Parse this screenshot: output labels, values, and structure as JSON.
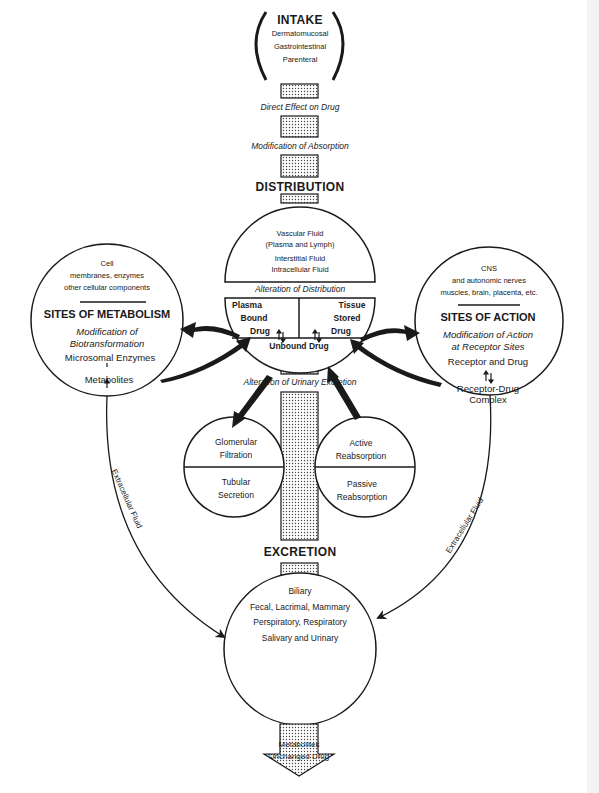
{
  "intake": {
    "title": "INTAKE",
    "routes": [
      "Dermatomucosal",
      "Gastrointestinal",
      "Parenteral"
    ]
  },
  "flow_labels": {
    "direct_effect": "Direct Effect on Drug",
    "modification_absorption": "Modification of Absorption",
    "alteration_distribution": "Alteration of Distribution",
    "alteration_urinary": "Alteration of Urinary Excretion"
  },
  "distribution": {
    "title": "DISTRIBUTION",
    "fluids": [
      "Vascular Fluid",
      "(Plasma and Lymph)",
      "Interstitial Fluid",
      "Intracellular Fluid"
    ],
    "plasma_bound": [
      "Plasma",
      "Bound",
      "Drug"
    ],
    "tissue_stored": [
      "Tissue",
      "Stored",
      "Drug"
    ],
    "unbound": "Unbound Drug"
  },
  "metabolism": {
    "components": [
      "Cell",
      "membranes, enzymes",
      "other cellular components"
    ],
    "title": "SITES OF METABOLISM",
    "modification": [
      "Modification of",
      "Biotransformation"
    ],
    "enzymes": "Microsomal Enzymes",
    "metabolites": "Metabolites"
  },
  "action": {
    "components": [
      "CNS",
      "and autonomic nerves",
      "muscles, brain, placenta, etc."
    ],
    "title": "SITES OF ACTION",
    "modification": [
      "Modification of Action",
      "at Receptor Sites"
    ],
    "receptor": "Receptor and Drug",
    "complex": [
      "Receptor-Drug",
      "Complex"
    ]
  },
  "kidney": {
    "left_top": [
      "Glomerular",
      "Filtration"
    ],
    "left_bottom": [
      "Tubular",
      "Secretion"
    ],
    "right_top": [
      "Active",
      "Reabsorption"
    ],
    "right_bottom": [
      "Passive",
      "Reabsorption"
    ]
  },
  "excretion": {
    "title": "EXCRETION",
    "routes": [
      "Biliary",
      "Fecal, Lacrimal, Mammary",
      "Perspiratory, Respiratory",
      "Salivary and Urinary"
    ],
    "output": [
      "Metabolites",
      "Unchanged Drug"
    ]
  },
  "side_labels": {
    "left": "Extracellular Fluid",
    "right": "Extracellular Fluid"
  },
  "colors": {
    "ink": "#1a1a1a",
    "paper": "#ffffff",
    "stipple": "#9a9a9a"
  }
}
